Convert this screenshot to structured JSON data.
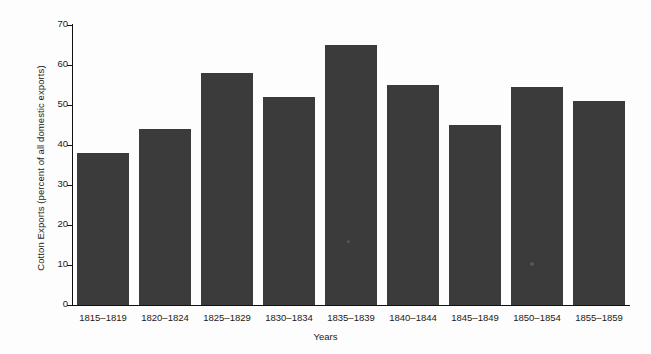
{
  "chart_data": {
    "type": "bar",
    "title": "",
    "xlabel": "Years",
    "ylabel": "Cotton Exports (percent of all domestic exports)",
    "categories": [
      "1815–1819",
      "1820–1824",
      "1825–1829",
      "1830–1834",
      "1835–1839",
      "1840–1844",
      "1845–1849",
      "1850–1854",
      "1855–1859"
    ],
    "values": [
      38,
      44,
      58,
      52,
      65,
      55,
      45,
      54.5,
      51
    ],
    "ylim": [
      0,
      70
    ],
    "yticks": [
      0,
      10,
      20,
      30,
      40,
      50,
      60,
      70
    ],
    "ytick_labels": [
      "0",
      "10",
      "20",
      "30",
      "40",
      "50",
      "60",
      "70"
    ],
    "grid": false,
    "legend": false,
    "bar_color": "#3b3b3b",
    "background_color": "#fdfdfd",
    "axis_color": "#111111"
  }
}
